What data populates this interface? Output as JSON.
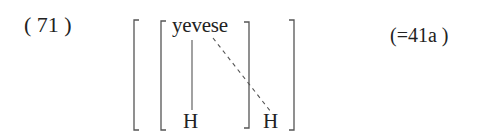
{
  "example": {
    "number": "( 71 )",
    "reference": "(=41a )"
  },
  "diagram": {
    "tone_bearing_word": "yevese",
    "tones": [
      {
        "label": "H",
        "association": "solid"
      },
      {
        "label": "H",
        "association": "dashed"
      }
    ],
    "brackets": {
      "outer": [
        "[",
        "]"
      ],
      "inner": [
        "[",
        "]"
      ]
    }
  },
  "colors": {
    "ink": "#222222",
    "line": "#555555",
    "background": "#ffffff"
  }
}
